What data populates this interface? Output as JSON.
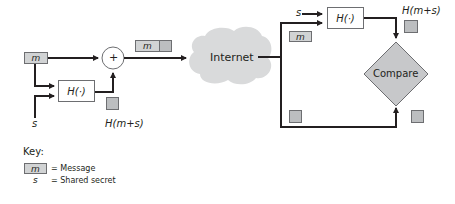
{
  "diagram": {
    "sender": {
      "message_label": "m",
      "secret_label": "s",
      "hash_label": "H(·)",
      "plus_label": "+",
      "mac_label": "H(m+s)",
      "packet_message_label": "m"
    },
    "network": {
      "cloud_label": "Internet"
    },
    "receiver": {
      "secret_label": "s",
      "hash_label": "H(·)",
      "message_label": "m",
      "mac_label": "H(m+s)",
      "compare_label": "Compare"
    },
    "key": {
      "title": "Key:",
      "items": [
        {
          "symbol": "m",
          "description": "= Message"
        },
        {
          "symbol": "s",
          "description": "= Shared secret"
        }
      ]
    },
    "colors": {
      "line": "#231f20",
      "box_fill": "#d1d3d4",
      "hash_square_fill": "#bcbec0",
      "cloud_fill": "#d9dadb",
      "diamond_fill": "#c7c8ca",
      "border": "#6d6e71"
    }
  }
}
